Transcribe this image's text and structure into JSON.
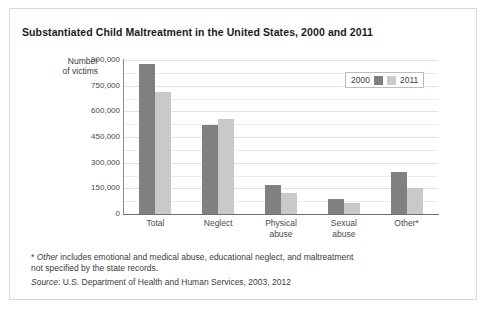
{
  "chart_data": {
    "type": "bar",
    "title": "Substantiated Child Maltreatment in the United States, 2000 and 2011",
    "xlabel": "",
    "ylabel": "Number of victims",
    "ylim": [
      0,
      900000
    ],
    "ytick_labels": [
      "900,000",
      "750,000",
      "600,000",
      "450,000",
      "300,000",
      "150,000",
      "0"
    ],
    "ytick_values": [
      900000,
      750000,
      600000,
      450000,
      300000,
      150000,
      0
    ],
    "grid": true,
    "minor_grid": true,
    "legend_position": "top-right",
    "categories": [
      "Total",
      "Neglect",
      "Physical abuse",
      "Sexual abuse",
      "Other*"
    ],
    "series": [
      {
        "name": "2000",
        "color": "#808080",
        "values": [
          879000,
          520000,
          170000,
          90000,
          245000
        ]
      },
      {
        "name": "2011",
        "color": "#c9c9c9",
        "values": [
          715000,
          555000,
          125000,
          65000,
          150000
        ]
      }
    ]
  },
  "axis_title": {
    "line1": "Number",
    "line2": "of victims"
  },
  "category_labels": [
    {
      "line1": "Total",
      "line2": ""
    },
    {
      "line1": "Neglect",
      "line2": ""
    },
    {
      "line1": "Physical",
      "line2": "abuse"
    },
    {
      "line1": "Sexual",
      "line2": "abuse"
    },
    {
      "line1": "Other*",
      "line2": ""
    }
  ],
  "legend": {
    "entry_2000_label": "2000",
    "entry_2011_label": "2011"
  },
  "footnote": {
    "marker": "*",
    "italic_word": "Other",
    "text": " includes emotional and medical abuse, educational neglect, and maltreatment not specified by the state records."
  },
  "source": {
    "label": "Source",
    "text": ": U.S. Department of Health and Human Services, 2003, 2012"
  }
}
